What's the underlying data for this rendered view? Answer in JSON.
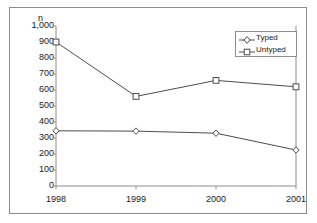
{
  "chart_data": {
    "type": "line",
    "title": "",
    "subtitle": "",
    "xlabel": "",
    "ylabel": "n",
    "categories": [
      "1998",
      "1999",
      "2000",
      "2001"
    ],
    "series": [
      {
        "name": "Typed",
        "marker": "diamond",
        "values": [
          345,
          343,
          330,
          225
        ]
      },
      {
        "name": "Untyped",
        "marker": "square",
        "values": [
          900,
          560,
          660,
          620
        ]
      }
    ],
    "ylim": [
      0,
      1000
    ],
    "yticks": [
      0,
      100,
      200,
      300,
      400,
      500,
      600,
      700,
      800,
      900,
      1000
    ],
    "ytick_labels": [
      "0",
      "100",
      "200",
      "300",
      "400",
      "500",
      "600",
      "700",
      "800",
      "900",
      "1,000"
    ],
    "grid": false,
    "legend_position": "top-right",
    "line_color": "#4d4d4d",
    "marker_fill": "#ffffff",
    "marker_edge": "#4d4d4d",
    "axis_color": "#8c8c8c",
    "text_color": "#1a1a1a",
    "background": "#ffffff"
  },
  "legend": {
    "entries": [
      {
        "label": "Typed"
      },
      {
        "label": "Untyped"
      }
    ]
  },
  "axes": {
    "y_axis_title": "n"
  }
}
